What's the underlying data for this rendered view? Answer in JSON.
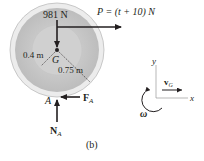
{
  "figure": {
    "label": "(b)",
    "weight_label": "981 N",
    "force_p_label": "P = (t + 10) N",
    "center_label": "G",
    "inner_radius_label": "0.4 m",
    "outer_radius_label": "0.75 m",
    "contact_point_label": "A",
    "friction_label": "F",
    "friction_sub": "A",
    "normal_label": "N",
    "normal_sub": "A"
  },
  "kinematics": {
    "y_axis_label": "y",
    "x_axis_label": "x",
    "velocity_label": "v",
    "velocity_sub": "G",
    "omega_label": "ω"
  },
  "colors": {
    "outer_rim": "#e6e6e6",
    "disk_fill": "#c8c8c8",
    "hub_fill": "#cfcfcf",
    "ink": "#231f20"
  }
}
